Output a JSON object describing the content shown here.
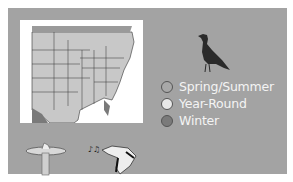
{
  "panel": {
    "background": "#a3a3a3"
  },
  "map": {
    "label": "range-map",
    "colors": {
      "land": "#c8c8c8",
      "water": "#ffffff",
      "winter": "#7a7a7a",
      "borders": "#333333"
    }
  },
  "bird": {
    "icon": "perched-bird-silhouette",
    "color": "#2a2a2a"
  },
  "legend": {
    "items": [
      {
        "label": "Spring/Summer",
        "color": "#a8a8a8"
      },
      {
        "label": "Year-Round",
        "color": "#e8e8e8"
      },
      {
        "label": "Winter",
        "color": "#7a7a7a"
      }
    ]
  },
  "icons": {
    "feeder": "bird-feeder-icon",
    "song": "singing-bird-icon"
  }
}
